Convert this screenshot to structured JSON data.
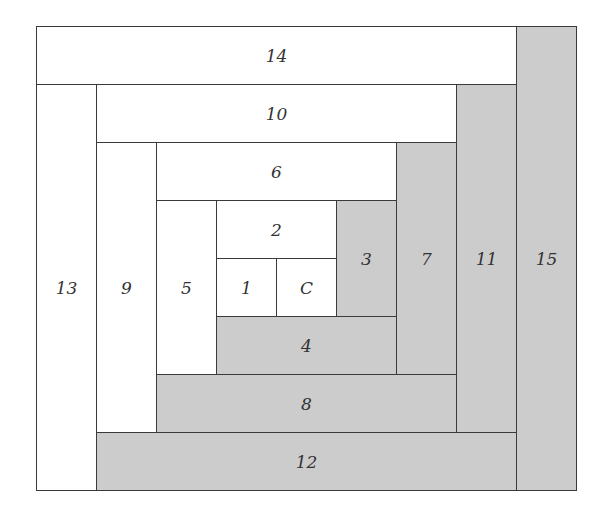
{
  "diagram": {
    "colors": {
      "light": "#ffffff",
      "dark": "#cccccc",
      "line": "#3a3a3a"
    },
    "pieces": [
      {
        "label": "C",
        "fill": "light",
        "x": 276,
        "y": 258,
        "w": 60,
        "h": 58
      },
      {
        "label": "1",
        "fill": "light",
        "x": 216,
        "y": 258,
        "w": 60,
        "h": 58
      },
      {
        "label": "2",
        "fill": "light",
        "x": 216,
        "y": 200,
        "w": 120,
        "h": 58
      },
      {
        "label": "3",
        "fill": "dark",
        "x": 336,
        "y": 200,
        "w": 60,
        "h": 116
      },
      {
        "label": "4",
        "fill": "dark",
        "x": 216,
        "y": 316,
        "w": 180,
        "h": 58
      },
      {
        "label": "5",
        "fill": "light",
        "x": 156,
        "y": 200,
        "w": 60,
        "h": 174
      },
      {
        "label": "6",
        "fill": "light",
        "x": 156,
        "y": 142,
        "w": 240,
        "h": 58
      },
      {
        "label": "7",
        "fill": "dark",
        "x": 396,
        "y": 142,
        "w": 60,
        "h": 232
      },
      {
        "label": "8",
        "fill": "dark",
        "x": 156,
        "y": 374,
        "w": 300,
        "h": 58
      },
      {
        "label": "9",
        "fill": "light",
        "x": 96,
        "y": 142,
        "w": 60,
        "h": 290
      },
      {
        "label": "10",
        "fill": "light",
        "x": 96,
        "y": 84,
        "w": 360,
        "h": 58
      },
      {
        "label": "11",
        "fill": "dark",
        "x": 456,
        "y": 84,
        "w": 60,
        "h": 348
      },
      {
        "label": "12",
        "fill": "dark",
        "x": 96,
        "y": 432,
        "w": 420,
        "h": 58
      },
      {
        "label": "13",
        "fill": "light",
        "x": 36,
        "y": 84,
        "w": 60,
        "h": 406
      },
      {
        "label": "14",
        "fill": "light",
        "x": 36,
        "y": 26,
        "w": 480,
        "h": 58
      },
      {
        "label": "15",
        "fill": "dark",
        "x": 516,
        "y": 26,
        "w": 60,
        "h": 464
      }
    ]
  }
}
